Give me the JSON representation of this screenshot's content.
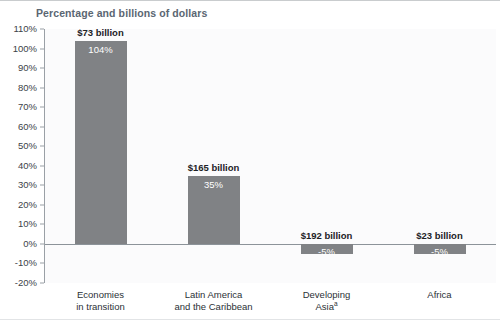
{
  "subtitle": "Percentage and billions of dollars",
  "chart_data": {
    "type": "bar",
    "title": "",
    "subtitle": "Percentage and billions of dollars",
    "xlabel": "",
    "ylabel": "",
    "ylim": [
      -20,
      110
    ],
    "ytick_step": 10,
    "grid": false,
    "legend": null,
    "categories": [
      "Economies in transition",
      "Latin America and the Caribbean",
      "Developing Asia",
      "Africa"
    ],
    "category_lines": [
      [
        "Economies",
        "in transition"
      ],
      [
        "Latin America",
        "and the Caribbean"
      ],
      [
        "Developing",
        "Asia"
      ],
      [
        "Africa"
      ]
    ],
    "category_footnotes": [
      "",
      "",
      "a",
      ""
    ],
    "values": [
      104,
      35,
      -5,
      -5
    ],
    "value_labels": [
      "104%",
      "35%",
      "-5%",
      "-5%"
    ],
    "amount_labels": [
      "$73 billion",
      "$165 billion",
      "$192 billion",
      "$23 billion"
    ],
    "ytick_labels": [
      "110%",
      "100%",
      "90%",
      "80%",
      "70%",
      "60%",
      "50%",
      "40%",
      "30%",
      "20%",
      "10%",
      "0%",
      "-10%",
      "-20%"
    ],
    "ytick_values": [
      110,
      100,
      90,
      80,
      70,
      60,
      50,
      40,
      30,
      20,
      10,
      0,
      -10,
      -20
    ],
    "bar_color": "#808285",
    "plot_background": "#fbfbfc",
    "axis_color": "#9aa0a6"
  }
}
